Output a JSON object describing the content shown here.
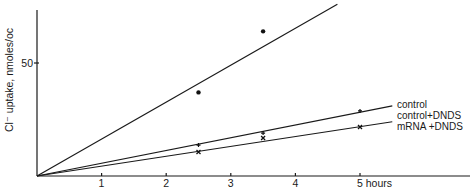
{
  "chart_data": {
    "type": "line",
    "title": "",
    "xlabel": "hours",
    "ylabel": "Cl⁻ uptake, nmoles/oc",
    "xlim": [
      0,
      5.7
    ],
    "ylim": [
      0,
      75
    ],
    "x_ticks": [
      1,
      2,
      3,
      4,
      5
    ],
    "x_tick_labels": [
      "1",
      "2",
      "3",
      "4",
      "5 hours"
    ],
    "y_ticks": [
      50
    ],
    "y_tick_labels": [
      "50"
    ],
    "grid": false,
    "series": [
      {
        "name": "mRNA",
        "marker": "dot",
        "points": [
          [
            2.5,
            37
          ],
          [
            3.5,
            64
          ]
        ],
        "fit_line": [
          [
            0,
            0
          ],
          [
            4.65,
            76
          ]
        ],
        "label": ""
      },
      {
        "name": "control",
        "marker": "plus",
        "points": [
          [
            2.5,
            13.7
          ],
          [
            3.5,
            19
          ],
          [
            5,
            28.8
          ]
        ],
        "fit_line": [
          [
            0,
            0
          ],
          [
            5.5,
            31
          ]
        ],
        "label": "control"
      },
      {
        "name": "control + DNDS",
        "marker": "plus",
        "points": [],
        "fit_line": [],
        "label": "control+DNDS"
      },
      {
        "name": "mRNA + DNDS",
        "marker": "cross",
        "points": [
          [
            2.5,
            10.6
          ],
          [
            3.5,
            16.8
          ],
          [
            5,
            21.7
          ]
        ],
        "fit_line": [
          [
            0,
            0
          ],
          [
            5.5,
            24
          ]
        ],
        "label": "mRNA +DNDS"
      }
    ],
    "legend": "right, inline labels at line ends"
  }
}
